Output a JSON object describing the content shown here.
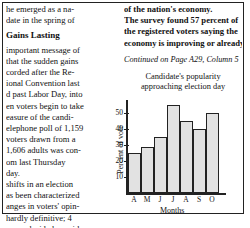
{
  "article": {
    "left_lines": [
      "he emerged as a na-",
      "date in the spring of"
    ],
    "heading": "Gains Lasting",
    "left_lines2": [
      "important message of",
      "that the sudden gains",
      "corded after the Re-",
      "ional Convention last",
      "d past Labor Day, into",
      "en voters begin to take",
      "easure of the candi-",
      "elephone poll of 1,159",
      "voters drawn from a",
      "1,606 adults was con-",
      "om last Thursday",
      "day.",
      "shifts in an election",
      "as been characterized",
      "anges in voters' opin-",
      "hardly definitive; 4",
      "are undecided or said",
      "still change their cur-"
    ],
    "right_lines": [
      "of the nation's economy.",
      "The survey found 57 percent of",
      "the registered voters saying the",
      "economy is improving or already"
    ],
    "continued": "Continued on Page A29, Column 5"
  },
  "chart_data": {
    "type": "bar",
    "title": "Candidate's popularity approaching election day",
    "title_lines": [
      "Candidate's popularity",
      "approaching election day"
    ],
    "categories": [
      "A",
      "M",
      "J",
      "J",
      "A",
      "S",
      "O"
    ],
    "values": [
      25,
      29,
      35,
      55,
      45,
      40,
      50
    ],
    "xlabel": "Months",
    "ylabel": "Percent of vote",
    "yticks": [
      "10",
      "20",
      "30",
      "40",
      "50"
    ],
    "ylim": [
      0,
      58
    ],
    "grid": false
  }
}
